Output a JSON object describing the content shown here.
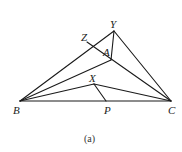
{
  "figure": {
    "caption": "(a)",
    "points": {
      "B": {
        "label": "B",
        "x": 20,
        "y": 101
      },
      "C": {
        "label": "C",
        "x": 171,
        "y": 101
      },
      "Y": {
        "label": "Y",
        "x": 114,
        "y": 31
      },
      "Z": {
        "label": "Z",
        "x": 87,
        "y": 42
      },
      "A": {
        "label": "A",
        "x": 111,
        "y": 60
      },
      "X": {
        "label": "X",
        "x": 94,
        "y": 84
      },
      "P": {
        "label": "P",
        "x": 106,
        "y": 101
      }
    },
    "segments": [
      [
        "B",
        "Y"
      ],
      [
        "Y",
        "C"
      ],
      [
        "B",
        "C"
      ],
      [
        "B",
        "A"
      ],
      [
        "Y",
        "A"
      ],
      [
        "Z",
        "C"
      ],
      [
        "B",
        "X"
      ],
      [
        "X",
        "C"
      ],
      [
        "X",
        "P"
      ]
    ],
    "labels": {
      "B": "B",
      "C": "C",
      "Y": "Y",
      "Z": "Z",
      "A": "A",
      "X": "X",
      "P": "P"
    }
  }
}
